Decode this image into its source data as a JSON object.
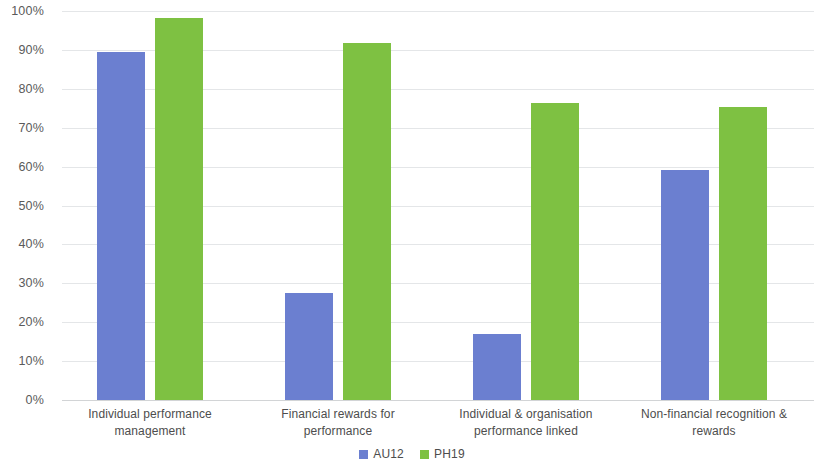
{
  "chart_data": {
    "type": "bar",
    "title": "",
    "subtitle": "",
    "xlabel": "",
    "ylabel": "",
    "grid": true,
    "legend_position": "bottom",
    "ylim": [
      0,
      100
    ],
    "ytick_labels": [
      "100%",
      "90%",
      "80%",
      "70%",
      "60%",
      "50%",
      "40%",
      "30%",
      "20%",
      "10%",
      "0%"
    ],
    "ytick_values": [
      100,
      90,
      80,
      70,
      60,
      50,
      40,
      30,
      20,
      10,
      0
    ],
    "categories": [
      "Individual performance management",
      "Financial rewards for performance",
      "Individual & organisation performance linked",
      "Non-financial recognition & rewards"
    ],
    "category_lines": [
      [
        "Individual performance",
        "management"
      ],
      [
        "Financial rewards for",
        "performance"
      ],
      [
        "Individual & organisation",
        "performance linked"
      ],
      [
        "Non-financial recognition &",
        "rewards"
      ]
    ],
    "series": [
      {
        "name": "AU12",
        "color": "#6b7fd0",
        "values": [
          89.5,
          27.6,
          17.0,
          59.2
        ]
      },
      {
        "name": "PH19",
        "color": "#7ec142",
        "values": [
          98.2,
          91.8,
          76.3,
          75.2
        ]
      }
    ]
  }
}
